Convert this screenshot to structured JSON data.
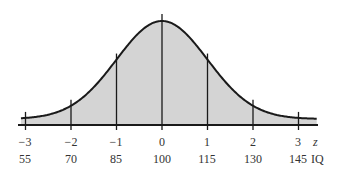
{
  "chart_data": {
    "type": "area",
    "title": "",
    "xlabel_primary": "z",
    "xlabel_secondary": "IQ",
    "z_ticks": [
      "−3",
      "−2",
      "−1",
      "0",
      "1",
      "2",
      "3"
    ],
    "z_values": [
      -3,
      -2,
      -1,
      0,
      1,
      2,
      3
    ],
    "iq_ticks": [
      "55",
      "70",
      "85",
      "100",
      "115",
      "130",
      "145"
    ],
    "iq_values": [
      55,
      70,
      85,
      100,
      115,
      130,
      145
    ],
    "mean": 100,
    "sd": 15,
    "xlim": [
      -3.2,
      3.2
    ],
    "grid": false,
    "legend": null
  },
  "colors": {
    "fill": "#d4d4d4",
    "line": "#1a1a1a",
    "text": "#333333"
  }
}
